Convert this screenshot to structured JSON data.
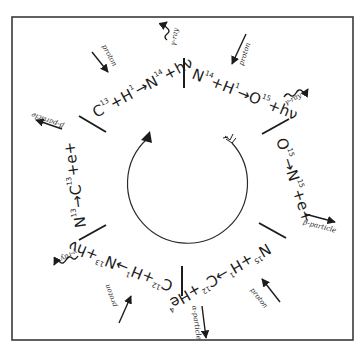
{
  "diagram": {
    "colors": {
      "ink": "#1c1c1c",
      "frame": "#3a3a3a",
      "background": "#ffffff"
    },
    "steps": [
      {
        "id": "step1",
        "reaction": "C¹³+H¹→N¹⁴+hν",
        "parts": [
          "C",
          "13",
          "+H",
          "1",
          "→N",
          "14",
          "+hν"
        ],
        "inputs": [
          "proton"
        ],
        "outputs": [
          "γ-ray"
        ]
      },
      {
        "id": "step2",
        "reaction": "N¹⁴+H¹→O¹⁵+hν",
        "parts": [
          "N",
          "14",
          "+H",
          "1",
          "→O",
          "15",
          "+hν"
        ],
        "inputs": [
          "proton"
        ],
        "outputs": [
          "γ-ray"
        ]
      },
      {
        "id": "step3",
        "reaction": "O¹⁵→N¹⁵+e⁺",
        "parts": [
          "O",
          "15",
          "→N",
          "15",
          "+e+"
        ],
        "outputs": [
          "β-particle"
        ]
      },
      {
        "id": "step4",
        "reaction": "N¹⁵+H¹→C¹²+He⁴",
        "parts": [
          "N",
          "15",
          "+H",
          "1",
          "→C",
          "12",
          "+He",
          "4"
        ],
        "inputs": [
          "proton"
        ],
        "outputs": [
          "α-particle"
        ]
      },
      {
        "id": "step5",
        "reaction": "C¹²+H¹→N¹³+hν",
        "parts": [
          "C",
          "12",
          "+H",
          "1",
          "→N",
          "13",
          "+hν"
        ],
        "inputs": [
          "proton"
        ],
        "outputs": [
          "γ-ray"
        ]
      },
      {
        "id": "step6",
        "reaction": "N¹³→C¹³+e⁺",
        "parts": [
          "N",
          "13",
          "→C",
          "13",
          "+e+"
        ],
        "outputs": [
          "β-particle"
        ]
      }
    ],
    "labels": {
      "proton": "proton",
      "gamma_ray": "γ-ray",
      "beta_particle": "β-particle",
      "alpha_particle": "α-particle"
    }
  }
}
